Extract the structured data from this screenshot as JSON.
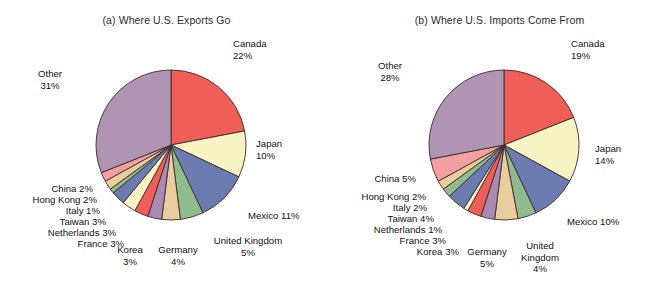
{
  "figure": {
    "background": "#ffffff",
    "panels": [
      "a",
      "b"
    ]
  },
  "palette": {
    "canada": "#ef5f58",
    "japan": "#f7f3c2",
    "mexico": "#6d7cb0",
    "united_kingdom": "#8fbb8e",
    "germany": "#e9cd9d",
    "korea": "#a98bb2",
    "france": "#ef5f58",
    "netherlands": "#f7f3c2",
    "taiwan": "#6d7cb0",
    "italy": "#8fbb8e",
    "hong_kong": "#e9cd9d",
    "china": "#f4a0a2",
    "other": "#b094b4",
    "outline": "#3a2a28",
    "text": "#111111"
  },
  "chart_data": [
    {
      "type": "pie",
      "id": "exports",
      "title": "(a) Where U.S. Exports Go",
      "start_angle_deg": 0,
      "direction": "clockwise",
      "labels": [
        "Canada",
        "Japan",
        "Mexico",
        "United Kingdom",
        "Germany",
        "Korea",
        "France",
        "Netherlands",
        "Taiwan",
        "Italy",
        "Hong Kong",
        "China",
        "Other"
      ],
      "values": [
        22,
        10,
        11,
        5,
        4,
        3,
        3,
        3,
        3,
        1,
        2,
        2,
        31
      ],
      "unit": "%",
      "slice_labels": [
        {
          "name": "Canada",
          "line1": "Canada",
          "line2": "22%"
        },
        {
          "name": "Japan",
          "line1": "Japan",
          "line2": "10%"
        },
        {
          "name": "Mexico",
          "line1": "Mexico 11%",
          "line2": ""
        },
        {
          "name": "United Kingdom",
          "line1": "United Kingdom",
          "line2": "5%"
        },
        {
          "name": "Germany",
          "line1": "Germany",
          "line2": "4%"
        },
        {
          "name": "Korea",
          "line1": "Korea",
          "line2": "3%"
        },
        {
          "name": "France",
          "line1": "France 3%",
          "line2": ""
        },
        {
          "name": "Netherlands",
          "line1": "Netherlands 3%",
          "line2": ""
        },
        {
          "name": "Taiwan",
          "line1": "Taiwan 3%",
          "line2": ""
        },
        {
          "name": "Italy",
          "line1": "Italy 1%",
          "line2": ""
        },
        {
          "name": "Hong Kong",
          "line1": "Hong Kong 2%",
          "line2": ""
        },
        {
          "name": "China",
          "line1": "China 2%",
          "line2": ""
        },
        {
          "name": "Other",
          "line1": "Other",
          "line2": "31%"
        }
      ]
    },
    {
      "type": "pie",
      "id": "imports",
      "title": "(b) Where U.S. Imports Come From",
      "start_angle_deg": 0,
      "direction": "clockwise",
      "labels": [
        "Canada",
        "Japan",
        "Mexico",
        "United Kingdom",
        "Germany",
        "Korea",
        "France",
        "Netherlands",
        "Taiwan",
        "Italy",
        "Hong Kong",
        "China",
        "Other"
      ],
      "values": [
        19,
        14,
        10,
        4,
        5,
        3,
        3,
        1,
        4,
        2,
        2,
        5,
        28
      ],
      "unit": "%",
      "slice_labels": [
        {
          "name": "Canada",
          "line1": "Canada",
          "line2": "19%"
        },
        {
          "name": "Japan",
          "line1": "Japan",
          "line2": "14%"
        },
        {
          "name": "Mexico",
          "line1": "Mexico 10%",
          "line2": ""
        },
        {
          "name": "United Kingdom",
          "line1": "United",
          "line2": "Kingdom",
          "line3": "4%"
        },
        {
          "name": "Germany",
          "line1": "Germany",
          "line2": "5%"
        },
        {
          "name": "Korea",
          "line1": "Korea 3%",
          "line2": ""
        },
        {
          "name": "France",
          "line1": "France 3%",
          "line2": ""
        },
        {
          "name": "Netherlands",
          "line1": "Netherlands 1%",
          "line2": ""
        },
        {
          "name": "Taiwan",
          "line1": "Taiwan 4%",
          "line2": ""
        },
        {
          "name": "Italy",
          "line1": "Italy 2%",
          "line2": ""
        },
        {
          "name": "Hong Kong",
          "line1": "Hong Kong 2%",
          "line2": ""
        },
        {
          "name": "China",
          "line1": "China 5%",
          "line2": ""
        },
        {
          "name": "Other",
          "line1": "Other",
          "line2": "28%"
        }
      ]
    }
  ]
}
